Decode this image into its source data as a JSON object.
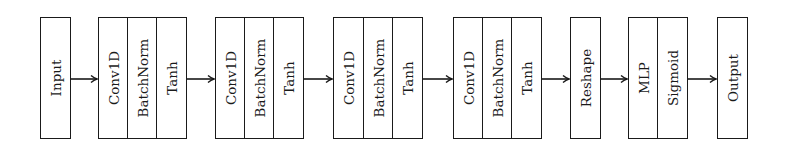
{
  "diagram": {
    "title": "",
    "nodes": [
      {
        "id": "input",
        "cells": [
          {
            "label": "Input",
            "x": 40,
            "w": 30
          }
        ]
      },
      {
        "id": "conv-block-1",
        "cells": [
          {
            "label": "Conv1D",
            "x": 98,
            "w": 30
          },
          {
            "label": "BatchNorm",
            "x": 127,
            "w": 30
          },
          {
            "label": "Tanh",
            "x": 156,
            "w": 31
          }
        ]
      },
      {
        "id": "conv-block-2",
        "cells": [
          {
            "label": "Conv1D",
            "x": 215,
            "w": 30
          },
          {
            "label": "BatchNorm",
            "x": 244,
            "w": 30
          },
          {
            "label": "Tanh",
            "x": 273,
            "w": 31
          }
        ]
      },
      {
        "id": "conv-block-3",
        "cells": [
          {
            "label": "Conv1D",
            "x": 333,
            "w": 31
          },
          {
            "label": "BatchNorm",
            "x": 363,
            "w": 30
          },
          {
            "label": "Tanh",
            "x": 392,
            "w": 31
          }
        ]
      },
      {
        "id": "conv-block-4",
        "cells": [
          {
            "label": "Conv1D",
            "x": 453,
            "w": 30
          },
          {
            "label": "BatchNorm",
            "x": 482,
            "w": 30
          },
          {
            "label": "Tanh",
            "x": 511,
            "w": 30
          }
        ]
      },
      {
        "id": "reshape",
        "cells": [
          {
            "label": "Reshape",
            "x": 570,
            "w": 30
          }
        ]
      },
      {
        "id": "mlp-block",
        "cells": [
          {
            "label": "MLP",
            "x": 628,
            "w": 30
          },
          {
            "label": "Sigmoid",
            "x": 657,
            "w": 31
          }
        ]
      },
      {
        "id": "output",
        "cells": [
          {
            "label": "Output",
            "x": 717,
            "w": 30
          }
        ]
      }
    ],
    "edges": [
      {
        "from": "input",
        "to": "conv-block-1",
        "x1": 70,
        "x2": 98
      },
      {
        "from": "conv-block-1",
        "to": "conv-block-2",
        "x1": 187,
        "x2": 215
      },
      {
        "from": "conv-block-2",
        "to": "conv-block-3",
        "x1": 304,
        "x2": 333
      },
      {
        "from": "conv-block-3",
        "to": "conv-block-4",
        "x1": 423,
        "x2": 453
      },
      {
        "from": "conv-block-4",
        "to": "reshape",
        "x1": 541,
        "x2": 570
      },
      {
        "from": "reshape",
        "to": "mlp-block",
        "x1": 600,
        "x2": 628
      },
      {
        "from": "mlp-block",
        "to": "output",
        "x1": 688,
        "x2": 717
      }
    ],
    "arrow_y": 79,
    "stroke_color": "#1a1a1a"
  },
  "labels": {
    "input": "Input",
    "c1_conv": "Conv1D",
    "c1_bn": "BatchNorm",
    "c1_tanh": "Tanh",
    "c2_conv": "Conv1D",
    "c2_bn": "BatchNorm",
    "c2_tanh": "Tanh",
    "c3_conv": "Conv1D",
    "c3_bn": "BatchNorm",
    "c3_tanh": "Tanh",
    "c4_conv": "Conv1D",
    "c4_bn": "BatchNorm",
    "c4_tanh": "Tanh",
    "reshape": "Reshape",
    "mlp": "MLP",
    "sigmoid": "Sigmoid",
    "output": "Output"
  }
}
